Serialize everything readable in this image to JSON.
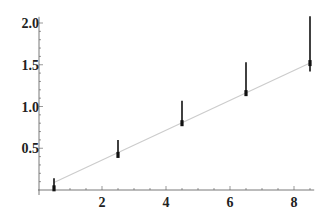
{
  "chart_data": {
    "type": "scatter",
    "title": "",
    "xlabel": "",
    "ylabel": "",
    "xlim": [
      0,
      8.6
    ],
    "ylim": [
      0,
      2.05
    ],
    "grid": false,
    "legend": null,
    "x_ticks": [
      2,
      4,
      6,
      8
    ],
    "x_tick_labels": [
      "2",
      "4",
      "6",
      "8"
    ],
    "y_ticks": [
      0.5,
      1.0,
      1.5,
      2.0
    ],
    "y_tick_labels": [
      "0.5",
      "1.0",
      "1.5",
      "2.0"
    ],
    "series": [
      {
        "name": "data",
        "style": "points-with-error-bars",
        "color": "#111111",
        "x": [
          0.5,
          2.5,
          4.5,
          6.5,
          8.5
        ],
        "y": [
          0.02,
          0.42,
          0.8,
          1.16,
          1.52
        ],
        "err_low": [
          0.0,
          0.42,
          0.8,
          1.14,
          1.42
        ],
        "err_high": [
          0.14,
          0.6,
          1.07,
          1.53,
          2.08
        ]
      },
      {
        "name": "fit",
        "style": "line",
        "color": "#cccccc",
        "x": [
          0.5,
          8.5
        ],
        "y": [
          0.09,
          1.52
        ]
      }
    ]
  },
  "colors": {
    "axis": "#555555",
    "points": "#111111",
    "fit_line": "#cccccc",
    "background": "#ffffff"
  }
}
